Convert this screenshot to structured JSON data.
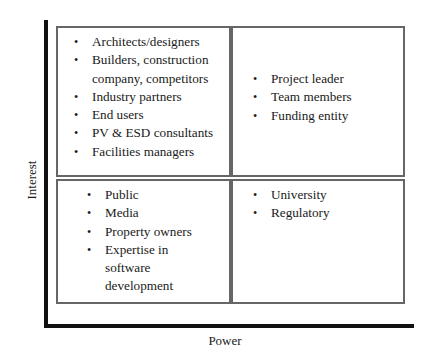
{
  "axes": {
    "y_label": "Interest",
    "x_label": "Power"
  },
  "quadrants": {
    "top_left": {
      "items": [
        "Architects/designers",
        "Builders, construction company, competitors",
        "Industry partners",
        "End users",
        "PV & ESD consultants",
        "Facilities managers"
      ]
    },
    "top_right": {
      "items": [
        "Project leader",
        "Team members",
        "Funding entity"
      ]
    },
    "bottom_left": {
      "items": [
        "Public",
        "Media",
        "Property owners",
        "Expertise in software development"
      ]
    },
    "bottom_right": {
      "items": [
        "University",
        "Regulatory"
      ]
    }
  }
}
